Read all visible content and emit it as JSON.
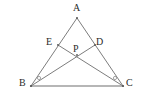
{
  "figure": {
    "type": "geometry-diagram",
    "background_color": "#ffffff",
    "line_color": "#7d7d7d",
    "baseline_color": "#6e6e6e",
    "label_color": "#2b2b2b",
    "point_color": "#555555",
    "angle_mark_color": "#999999",
    "line_width": 1
  },
  "points": {
    "A": {
      "label": "A",
      "x": 77,
      "y": 18,
      "label_x": 73,
      "label_y": 3
    },
    "B": {
      "label": "B",
      "x": 31,
      "y": 86,
      "label_x": 19,
      "label_y": 78
    },
    "C": {
      "label": "C",
      "x": 123,
      "y": 86,
      "label_x": 126,
      "label_y": 78
    },
    "D": {
      "label": "D",
      "x": 95,
      "y": 45,
      "label_x": 96,
      "label_y": 37
    },
    "E": {
      "label": "E",
      "x": 58,
      "y": 45,
      "label_x": 46,
      "label_y": 37
    },
    "P": {
      "label": "P",
      "x": 77,
      "y": 55,
      "label_x": 73,
      "label_y": 44
    }
  },
  "segments": [
    {
      "name": "side-AB",
      "from": "A",
      "to": "B"
    },
    {
      "name": "side-AC",
      "from": "A",
      "to": "C"
    },
    {
      "name": "side-BC",
      "from": "B",
      "to": "C"
    },
    {
      "name": "cevian-BD",
      "from": "B",
      "to": "D"
    },
    {
      "name": "cevian-CE",
      "from": "C",
      "to": "E"
    }
  ],
  "angle_marks": [
    {
      "name": "angle-mark-at-B",
      "vertex": "B",
      "x": 39,
      "y": 78,
      "radius": 1.6
    },
    {
      "name": "angle-mark-at-C",
      "vertex": "C",
      "x": 115,
      "y": 78,
      "radius": 1.6
    }
  ]
}
